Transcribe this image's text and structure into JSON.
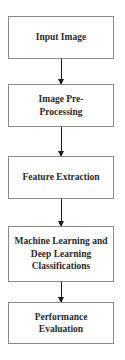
{
  "diagram": {
    "type": "flowchart",
    "direction": "top-to-bottom",
    "nodes": [
      {
        "id": "input",
        "label": "Input Image"
      },
      {
        "id": "preprocess",
        "label": "Image Pre-Processing"
      },
      {
        "id": "features",
        "label": "Feature Extraction"
      },
      {
        "id": "classify",
        "label": "Machine Learning and Deep Learning Classifications"
      },
      {
        "id": "evaluate",
        "label": "Performance Evaluation"
      }
    ],
    "edges": [
      {
        "from": "input",
        "to": "preprocess"
      },
      {
        "from": "preprocess",
        "to": "features"
      },
      {
        "from": "features",
        "to": "classify"
      },
      {
        "from": "classify",
        "to": "evaluate"
      }
    ],
    "colors": {
      "box_border": "#8a8a8a",
      "text": "#2a2a2a",
      "arrow": "#1a1a1a",
      "background": "#ffffff"
    }
  }
}
